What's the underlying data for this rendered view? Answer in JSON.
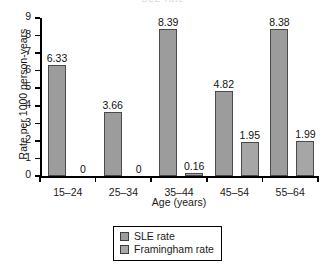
{
  "figure": {
    "clipped_title": "SLE rate",
    "width": 326,
    "height": 265
  },
  "chart_data": {
    "type": "bar",
    "title": "",
    "xlabel": "Age (years)",
    "ylabel": "Rate per 1000 person-years",
    "categories": [
      "15–24",
      "25–34",
      "35–44",
      "45–54",
      "55–64"
    ],
    "ylim": [
      0,
      9
    ],
    "yticks": [
      0,
      1,
      2,
      3,
      4,
      5,
      6,
      7,
      8,
      9
    ],
    "ytick_labels": [
      "0",
      "1",
      "2",
      "3",
      "4",
      "5",
      "6",
      "7",
      "8",
      "9"
    ],
    "grid": false,
    "legend_position": "bottom-center",
    "series": [
      {
        "name": "SLE rate",
        "color": "#9c9c9c",
        "values": [
          6.33,
          3.66,
          8.39,
          4.82,
          8.38
        ],
        "labels": [
          "6.33",
          "3.66",
          "8.39",
          "4.82",
          "8.38"
        ]
      },
      {
        "name": "Framingham rate",
        "color": "#a6a6a6",
        "values": [
          0,
          0,
          0.16,
          1.95,
          1.99
        ],
        "labels": [
          "0",
          "0",
          "0.16",
          "1.95",
          "1.99"
        ]
      }
    ]
  },
  "legend": {
    "entries": [
      {
        "label": "SLE rate"
      },
      {
        "label": "Framingham rate"
      }
    ]
  }
}
